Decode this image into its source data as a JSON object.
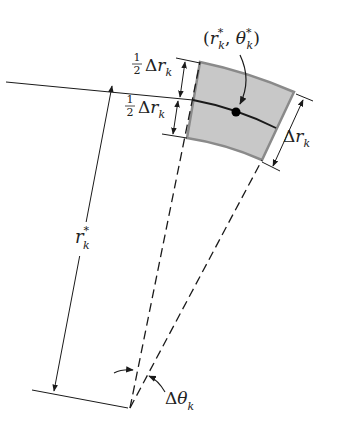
{
  "diagram": {
    "colors": {
      "line": "#1a1a1a",
      "sector_fill": "#c8c8c8",
      "sector_edge": "#8a8a8a",
      "point": "#000000"
    },
    "labels": {
      "point": {
        "open": "(",
        "r": "r",
        "r_sup": "*",
        "r_sub": "k",
        "comma": ", ",
        "theta": "θ",
        "theta_sup": "*",
        "theta_sub": "k",
        "close": ")"
      },
      "half_top": {
        "num": "1",
        "den": "2",
        "delta": "Δ",
        "r": "r",
        "sub": "k"
      },
      "half_bottom": {
        "num": "1",
        "den": "2",
        "delta": "Δ",
        "r": "r",
        "sub": "k"
      },
      "delta_r": {
        "delta": "Δ",
        "r": "r",
        "sub": "k"
      },
      "r_star": {
        "r": "r",
        "sup": "*",
        "sub": "k"
      },
      "delta_theta": {
        "delta": "Δ",
        "theta": "θ",
        "sub": "k"
      }
    }
  }
}
